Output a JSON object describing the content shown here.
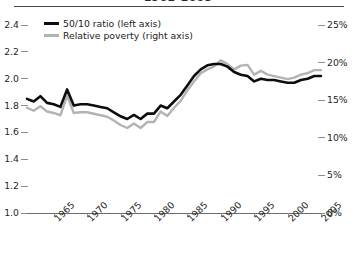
{
  "chart_data": {
    "type": "line",
    "title": "1961–2005",
    "xlabel": "",
    "ylabel": "",
    "grid": false,
    "legend_position": "top-left",
    "x": [
      1961,
      1962,
      1963,
      1964,
      1965,
      1966,
      1967,
      1968,
      1969,
      1970,
      1971,
      1972,
      1973,
      1974,
      1975,
      1976,
      1977,
      1978,
      1979,
      1980,
      1981,
      1982,
      1983,
      1984,
      1985,
      1986,
      1987,
      1988,
      1989,
      1990,
      1991,
      1992,
      1993,
      1994,
      1995,
      1996,
      1997,
      1998,
      1999,
      2000,
      2001,
      2002,
      2003,
      2004,
      2005
    ],
    "xticks": [
      1965,
      1970,
      1975,
      1980,
      1985,
      1990,
      1995,
      2000,
      2005
    ],
    "xtick_labels": [
      "1965",
      "1970",
      "1975",
      "1980",
      "1985",
      "1990",
      "1995",
      "2000",
      "2005"
    ],
    "left_axis": {
      "label": "50/10 ratio",
      "ticks": [
        1.0,
        1.2,
        1.4,
        1.6,
        1.8,
        2.0,
        2.2,
        2.4
      ],
      "tick_labels": [
        "1.0",
        "1.2",
        "1.4",
        "1.6",
        "1.8",
        "2.0",
        "2.2",
        "2.4"
      ],
      "ylim": [
        1.0,
        2.4
      ]
    },
    "right_axis": {
      "label": "Relative poverty",
      "ticks": [
        0,
        5,
        10,
        15,
        20,
        25
      ],
      "tick_labels": [
        "0%",
        "5%",
        "10%",
        "15%",
        "20%",
        "25%"
      ],
      "ylim": [
        0,
        25
      ]
    },
    "series": [
      {
        "name": "50/10 ratio (left axis)",
        "axis": "left",
        "color": "#0d0d0d",
        "width": 2.6,
        "values": [
          1.85,
          1.83,
          1.87,
          1.82,
          1.81,
          1.79,
          1.92,
          1.8,
          1.81,
          1.81,
          1.8,
          1.79,
          1.78,
          1.75,
          1.72,
          1.7,
          1.73,
          1.7,
          1.74,
          1.74,
          1.8,
          1.78,
          1.83,
          1.88,
          1.95,
          2.02,
          2.07,
          2.1,
          2.11,
          2.11,
          2.09,
          2.05,
          2.03,
          2.02,
          1.98,
          2.0,
          1.99,
          1.99,
          1.98,
          1.97,
          1.97,
          1.99,
          2.0,
          2.02,
          2.02
        ]
      },
      {
        "name": "Relative poverty (right axis)",
        "axis": "right",
        "color": "#b3b3b3",
        "width": 2.4,
        "values": [
          14.0,
          13.6,
          14.2,
          13.5,
          13.3,
          13.0,
          15.6,
          13.3,
          13.4,
          13.4,
          13.2,
          13.0,
          12.8,
          12.3,
          11.7,
          11.3,
          11.9,
          11.3,
          12.1,
          12.1,
          13.5,
          12.9,
          14.0,
          14.9,
          16.3,
          17.5,
          18.6,
          19.1,
          19.5,
          20.3,
          19.8,
          19.1,
          19.6,
          19.7,
          18.4,
          18.9,
          18.4,
          18.2,
          18.0,
          17.8,
          18.0,
          18.4,
          18.6,
          19.0,
          19.0
        ]
      }
    ]
  }
}
